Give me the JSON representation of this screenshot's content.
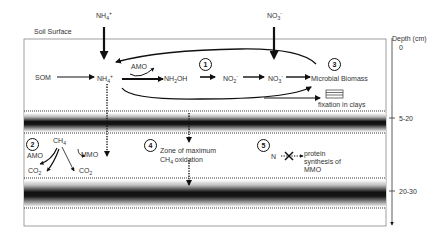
{
  "diagram": {
    "labels": {
      "soil_surface": "Soil Surface",
      "depth_axis_title": "Depth (cm)",
      "nh4_input": "NH4+",
      "no3_input": "NO3-",
      "som": "SOM",
      "nh4": "NH4+",
      "amo_top": "AMO",
      "nh2oh": "NH2OH",
      "no2": "NO2-",
      "no3": "NO3-",
      "microbial_biomass": "Microbial Biomass",
      "fixation_in_clays": "fixation in clays",
      "ch4": "CH4",
      "amo_low": "AMO",
      "mmo": "MMO",
      "co2_left": "CO2",
      "co2_right": "CO2",
      "zone_line1": "Zone of maximum",
      "zone_line2": "CH4 oxidation",
      "n": "N",
      "protein_line1": "protein",
      "protein_line2": "synthesis of",
      "protein_line3": "MMO"
    },
    "numbered_markers": [
      "1",
      "2",
      "3",
      "4",
      "5"
    ],
    "depth_ticks": [
      {
        "label": "0",
        "y": 47
      },
      {
        "label": "5-20",
        "y": 118
      },
      {
        "label": "20-30",
        "y": 191
      }
    ],
    "bands": [
      {
        "name": "5-20 cm layer",
        "top": 111,
        "bottom": 133
      },
      {
        "name": "20-30 cm layer",
        "top": 178,
        "bottom": 208
      }
    ],
    "colors": {
      "band_dark": "#111111",
      "line": "#111111",
      "box_border": "#888888"
    }
  }
}
